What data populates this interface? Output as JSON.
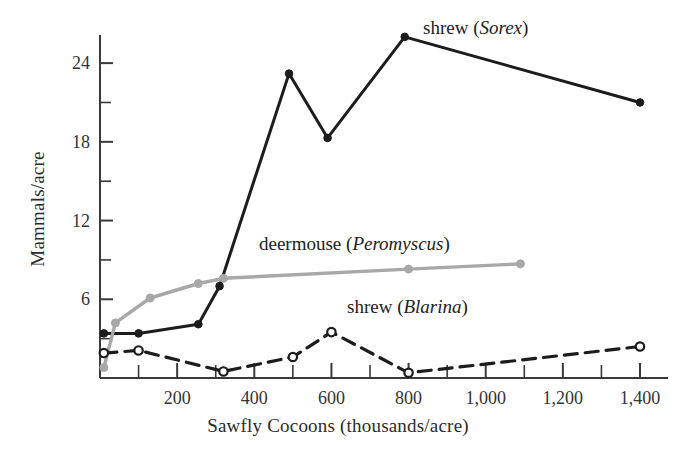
{
  "chart_data": {
    "type": "line",
    "title": "",
    "xlabel": "Sawfly Cocoons (thousands/acre)",
    "ylabel": "Mammals/acre",
    "xlim": [
      0,
      1450
    ],
    "ylim": [
      0,
      26
    ],
    "grid": false,
    "legend_position": "inline-annotations",
    "x_ticks": [
      {
        "value": 200,
        "label": "200"
      },
      {
        "value": 400,
        "label": "400"
      },
      {
        "value": 600,
        "label": "600"
      },
      {
        "value": 800,
        "label": "800"
      },
      {
        "value": 1000,
        "label": "1,000"
      },
      {
        "value": 1200,
        "label": "1,200"
      },
      {
        "value": 1400,
        "label": "1,400"
      }
    ],
    "x_minor_ticks": [
      100,
      300,
      500,
      700,
      900,
      1100,
      1300
    ],
    "y_ticks": [
      {
        "value": 6,
        "label": "6"
      },
      {
        "value": 12,
        "label": "12"
      },
      {
        "value": 18,
        "label": "18"
      },
      {
        "value": 24,
        "label": "24"
      }
    ],
    "y_minor_ticks": [
      3,
      9,
      15,
      21
    ],
    "series": [
      {
        "name": "shrew (Sorex)",
        "label_common": "shrew",
        "label_genus": "Sorex",
        "color": "#1c1c1c",
        "line_style": "solid",
        "marker": "filled-circle",
        "points": [
          {
            "x": 10,
            "y": 3.4
          },
          {
            "x": 100,
            "y": 3.4
          },
          {
            "x": 255,
            "y": 4.1
          },
          {
            "x": 310,
            "y": 7.0
          },
          {
            "x": 490,
            "y": 23.2
          },
          {
            "x": 590,
            "y": 18.3
          },
          {
            "x": 790,
            "y": 26.0
          },
          {
            "x": 1400,
            "y": 21.0
          }
        ]
      },
      {
        "name": "deermouse (Peromyscus)",
        "label_common": "deermouse",
        "label_genus": "Peromyscus",
        "color": "#a8a8a8",
        "line_style": "solid",
        "marker": "filled-circle",
        "points": [
          {
            "x": 10,
            "y": 0.8
          },
          {
            "x": 40,
            "y": 4.2
          },
          {
            "x": 130,
            "y": 6.1
          },
          {
            "x": 255,
            "y": 7.2
          },
          {
            "x": 320,
            "y": 7.6
          },
          {
            "x": 800,
            "y": 8.3
          },
          {
            "x": 1090,
            "y": 8.7
          }
        ]
      },
      {
        "name": "shrew (Blarina)",
        "label_common": "shrew",
        "label_genus": "Blarina",
        "color": "#1c1c1c",
        "line_style": "dashed",
        "marker": "open-circle",
        "points": [
          {
            "x": 10,
            "y": 1.9
          },
          {
            "x": 100,
            "y": 2.1
          },
          {
            "x": 320,
            "y": 0.5
          },
          {
            "x": 500,
            "y": 1.6
          },
          {
            "x": 600,
            "y": 3.5
          },
          {
            "x": 800,
            "y": 0.4
          },
          {
            "x": 1400,
            "y": 2.4
          }
        ]
      }
    ],
    "annotations": [
      {
        "name": "sorex-label",
        "text": "shrew (Sorex)",
        "x_px": 423,
        "y_px": 17
      },
      {
        "name": "peromyscus-label",
        "text": "deermouse (Peromyscus)",
        "x_px": 259,
        "y_px": 233
      },
      {
        "name": "blarina-label",
        "text": "shrew (Blarina)",
        "x_px": 347,
        "y_px": 296
      }
    ]
  },
  "axes": {
    "x_title": "Sawfly Cocoons (thousands/acre)",
    "y_title": "Mammals/acre"
  },
  "geometry": {
    "x0_px": 100,
    "x_span_px": 540,
    "x_max_value": 1400,
    "y0_px": 378,
    "y_unit_px": 13.12,
    "y_axis_top_px": 35
  }
}
